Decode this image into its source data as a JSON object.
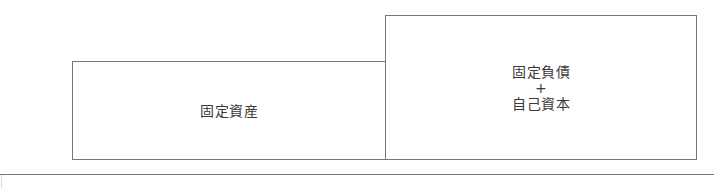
{
  "diagram": {
    "left_box": {
      "label": "固定資産"
    },
    "right_box": {
      "line1": "固定負債",
      "operator": "+",
      "line2": "自己資本"
    }
  }
}
